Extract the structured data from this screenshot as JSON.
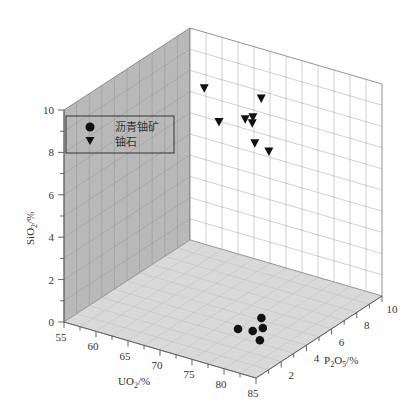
{
  "chart_data": {
    "type": "scatter3d",
    "title": "",
    "xlabel": "UO2/%",
    "ylabel": "P2O5/%",
    "zlabel": "SiO2/%",
    "xlabel_parts": {
      "a": "UO",
      "sub": "2",
      "b": "/%"
    },
    "ylabel_parts": {
      "a": "P",
      "sub1": "2",
      "mid": "O",
      "sub2": "5",
      "b": "/%"
    },
    "zlabel_parts": {
      "a": "SiO",
      "sub": "2",
      "b": "/%"
    },
    "xlim": [
      55,
      85
    ],
    "ylim": [
      0,
      10
    ],
    "zlim": [
      0,
      10
    ],
    "x_ticks": [
      55,
      60,
      65,
      70,
      75,
      80,
      85
    ],
    "y_ticks": [
      2,
      4,
      6,
      8,
      10
    ],
    "z_ticks": [
      0,
      2,
      4,
      6,
      8,
      10
    ],
    "grid": true,
    "legend_position": "upper-left",
    "legend": [
      {
        "name": "沥青铀矿",
        "marker": "circle"
      },
      {
        "name": "铀石",
        "marker": "triangle-down"
      }
    ],
    "series": [
      {
        "name": "沥青铀矿",
        "marker": "circle",
        "color": "#111111",
        "points": [
          {
            "UO2": 75.3,
            "P2O5": 3.5,
            "SiO2": 0.1
          },
          {
            "UO2": 77.2,
            "P2O5": 3.7,
            "SiO2": 0.1
          },
          {
            "UO2": 76.0,
            "P2O5": 5.0,
            "SiO2": 0.1
          },
          {
            "UO2": 77.8,
            "P2O5": 4.2,
            "SiO2": 0.1
          },
          {
            "UO2": 79.5,
            "P2O5": 3.1,
            "SiO2": 0.1
          }
        ]
      },
      {
        "name": "铀石",
        "marker": "triangle-down",
        "color": "#111111",
        "points": [
          {
            "UO2": 65.1,
            "P2O5": 6.0,
            "SiO2": 9.6
          },
          {
            "UO2": 74.0,
            "P2O5": 6.0,
            "SiO2": 9.9
          },
          {
            "UO2": 67.4,
            "P2O5": 6.0,
            "SiO2": 8.2
          },
          {
            "UO2": 71.5,
            "P2O5": 6.0,
            "SiO2": 8.7
          },
          {
            "UO2": 72.7,
            "P2O5": 6.0,
            "SiO2": 8.9
          },
          {
            "UO2": 72.6,
            "P2O5": 6.0,
            "SiO2": 8.6
          },
          {
            "UO2": 73.0,
            "P2O5": 6.0,
            "SiO2": 7.7
          },
          {
            "UO2": 75.2,
            "P2O5": 6.0,
            "SiO2": 7.5
          }
        ]
      }
    ]
  },
  "colors": {
    "left_wall": "#b9b9b9",
    "back_wall": "#ffffff",
    "floor": "#d9d9d9",
    "grid_line": "#8c8c8c",
    "axis": "#555555",
    "marker": "#111111"
  }
}
